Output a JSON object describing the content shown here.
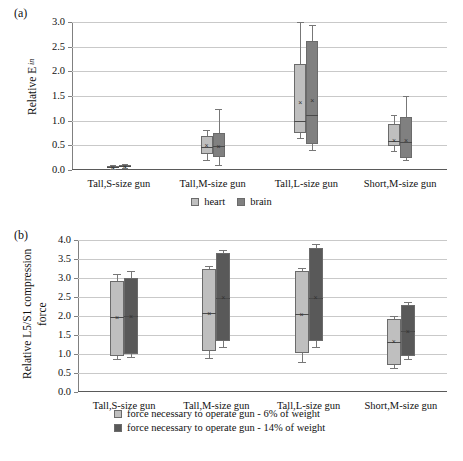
{
  "figure": {
    "panels": [
      {
        "id": "a",
        "label": "(a)",
        "chart_index": 0
      },
      {
        "id": "b",
        "label": "(b)",
        "chart_index": 1
      }
    ]
  },
  "chart_data": [
    {
      "type": "box",
      "panel": "(a)",
      "title": "",
      "ylabel_text": "Relative E",
      "ylabel_sub": "in",
      "xlabel": "",
      "ylim": [
        0.0,
        3.0
      ],
      "ytick_labels": [
        "0.0",
        "0.5",
        "1.0",
        "1.5",
        "2.0",
        "2.5",
        "3.0"
      ],
      "ytick_values": [
        0.0,
        0.5,
        1.0,
        1.5,
        2.0,
        2.5,
        3.0
      ],
      "grid": true,
      "legend_position": "bottom-center",
      "categories": [
        "Tall,S-size gun",
        "Tall,M-size gun",
        "Tall,L-size gun",
        "Short,M-size gun"
      ],
      "series": [
        {
          "name": "heart",
          "color": "#bfbfbf",
          "boxes": [
            {
              "min": 0.03,
              "q1": 0.05,
              "median": 0.07,
              "mean": 0.07,
              "q3": 0.09,
              "max": 0.11
            },
            {
              "min": 0.21,
              "q1": 0.33,
              "median": 0.46,
              "mean": 0.5,
              "q3": 0.69,
              "max": 0.82
            },
            {
              "min": 0.64,
              "q1": 0.74,
              "median": 1.0,
              "mean": 1.38,
              "q3": 2.14,
              "max": 2.99
            },
            {
              "min": 0.38,
              "q1": 0.48,
              "median": 0.58,
              "mean": 0.61,
              "q3": 0.94,
              "max": 1.11
            }
          ]
        },
        {
          "name": "brain",
          "color": "#808080",
          "boxes": [
            {
              "min": 0.04,
              "q1": 0.06,
              "median": 0.08,
              "mean": 0.08,
              "q3": 0.1,
              "max": 0.12
            },
            {
              "min": 0.1,
              "q1": 0.26,
              "median": 0.48,
              "mean": 0.48,
              "q3": 0.75,
              "max": 1.23
            },
            {
              "min": 0.4,
              "q1": 0.52,
              "median": 1.12,
              "mean": 1.42,
              "q3": 2.62,
              "max": 2.93
            },
            {
              "min": 0.2,
              "q1": 0.25,
              "median": 0.57,
              "mean": 0.6,
              "q3": 1.07,
              "max": 1.49
            }
          ]
        }
      ],
      "legend": [
        "heart",
        "brain"
      ]
    },
    {
      "type": "box",
      "panel": "(b)",
      "title": "",
      "ylabel_text": "Relative L5/S1 compression force",
      "xlabel": "",
      "ylim": [
        0.0,
        4.0
      ],
      "ytick_labels": [
        "0.0",
        "0.5",
        "1.0",
        "1.5",
        "2.0",
        "2.5",
        "3.0",
        "3.5",
        "4.0"
      ],
      "ytick_values": [
        0.0,
        0.5,
        1.0,
        1.5,
        2.0,
        2.5,
        3.0,
        3.5,
        4.0
      ],
      "grid": true,
      "legend_position": "bottom-center",
      "categories": [
        "Tall,S-size gun",
        "Tall,M-size gun",
        "Tall,L-size gun",
        "Short,M-size gun"
      ],
      "series": [
        {
          "name": "force necessary to operate gun - 6% of weight",
          "color": "#bfbfbf",
          "boxes": [
            {
              "min": 0.88,
              "q1": 0.95,
              "median": 1.97,
              "mean": 1.98,
              "q3": 2.92,
              "max": 3.11
            },
            {
              "min": 0.9,
              "q1": 1.07,
              "median": 2.08,
              "mean": 2.09,
              "q3": 3.23,
              "max": 3.31
            },
            {
              "min": 0.8,
              "q1": 1.03,
              "median": 2.04,
              "mean": 2.06,
              "q3": 3.19,
              "max": 3.27
            },
            {
              "min": 0.62,
              "q1": 0.72,
              "median": 1.32,
              "mean": 1.33,
              "q3": 1.92,
              "max": 2.0
            }
          ]
        },
        {
          "name": "force necessary to operate gun - 14% of weight",
          "color": "#595959",
          "boxes": [
            {
              "min": 0.92,
              "q1": 0.99,
              "median": 2.0,
              "mean": 2.01,
              "q3": 3.01,
              "max": 3.18
            },
            {
              "min": 1.19,
              "q1": 1.33,
              "median": 2.48,
              "mean": 2.49,
              "q3": 3.65,
              "max": 3.74
            },
            {
              "min": 1.18,
              "q1": 1.33,
              "median": 2.48,
              "mean": 2.49,
              "q3": 3.79,
              "max": 3.89
            },
            {
              "min": 0.86,
              "q1": 0.94,
              "median": 1.6,
              "mean": 1.61,
              "q3": 2.28,
              "max": 2.38
            }
          ]
        }
      ],
      "legend": [
        "force necessary to operate gun - 6% of weight",
        "force necessary to operate gun - 14% of weight"
      ]
    }
  ]
}
